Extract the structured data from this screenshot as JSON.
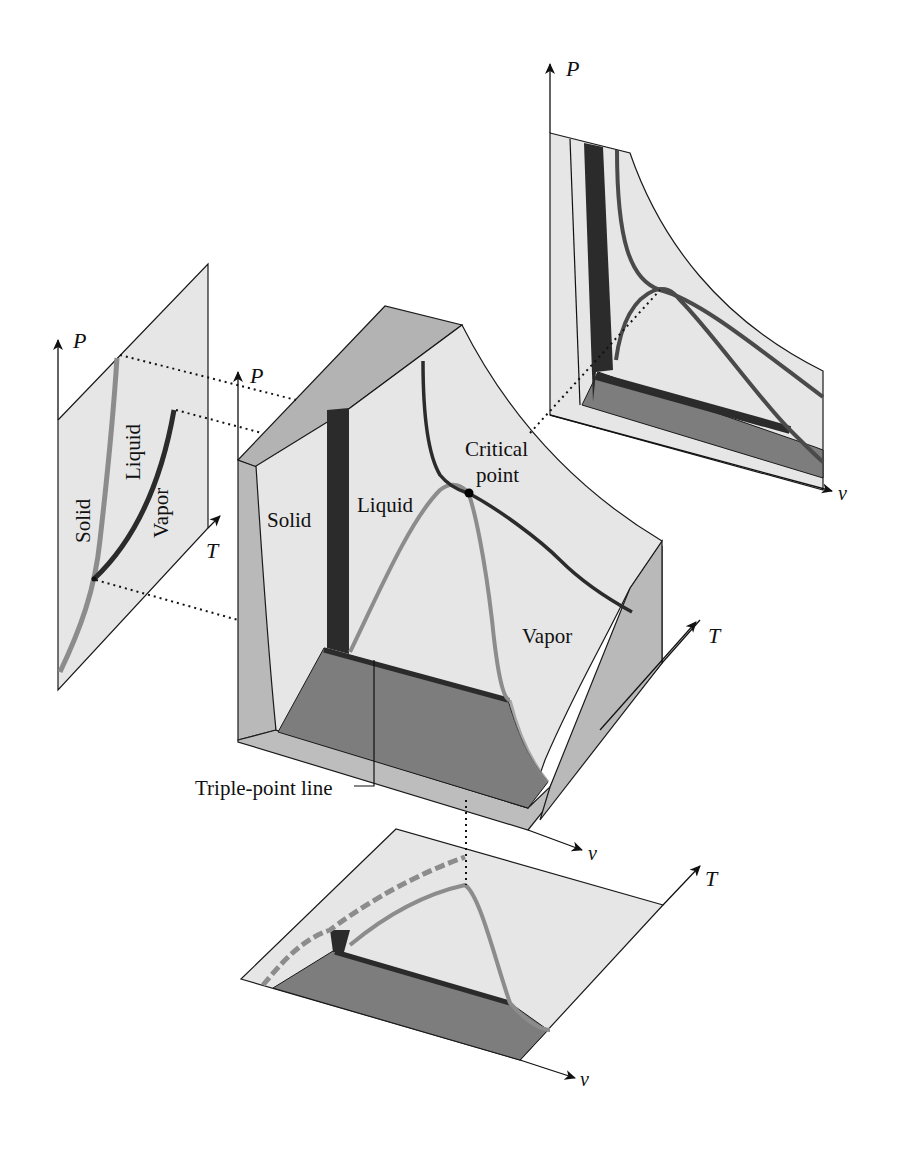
{
  "figure": {
    "colors": {
      "surface": "#e6e6e6",
      "side_face": "#b9b9b9",
      "two_phase_floor": "#7d7d7d",
      "dark_line": "#2b2b2b",
      "gray_curve": "#8c8c8c",
      "outline": "#1a1a1a"
    }
  },
  "pT_diagram": {
    "axis_p": "P",
    "axis_t": "T",
    "regions": {
      "solid": "Solid",
      "liquid": "Liquid",
      "vapor": "Vapor"
    }
  },
  "main_surface": {
    "axis_p": "P",
    "axis_t": "T",
    "axis_v": "v",
    "regions": {
      "solid": "Solid",
      "liquid": "Liquid",
      "vapor": "Vapor"
    },
    "critical_point": [
      "Critical",
      "point"
    ],
    "triple_point_line": "Triple-point line"
  },
  "pv_diagram": {
    "axis_p": "P",
    "axis_v": "v"
  },
  "tv_diagram": {
    "axis_t": "T",
    "axis_v": "v"
  }
}
